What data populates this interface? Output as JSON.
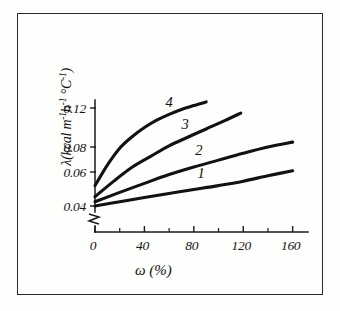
{
  "figure": {
    "has_frame": true,
    "background_color": "#fefefc",
    "ink_color": "#121212"
  },
  "chart_data": {
    "type": "line",
    "title": "",
    "subtitle": "",
    "xlabel": "ω (%)",
    "ylabel": "λ(kcal m⁻¹h⁻¹ °C⁻¹)",
    "ylabel_parts": {
      "symbol": "λ(kcal m",
      "sup1": "-1",
      "mid1": "h",
      "sup2": "-1",
      "mid2": " °C",
      "sup3": "-1",
      "close": ")"
    },
    "xlabel_parts": {
      "symbol": "ω",
      "unit": "(%)"
    },
    "xlim": [
      0,
      170
    ],
    "ylim": [
      0.036,
      0.132
    ],
    "axis_break_y": true,
    "axis_break_note": "zigzag break on y-axis below 0.04",
    "grid": false,
    "legend": "inline curve numbers",
    "xticks": [
      0,
      40,
      80,
      120,
      160
    ],
    "xtick_labels": [
      "0",
      "40",
      "80",
      "120",
      "160"
    ],
    "xticks_minor": [
      20,
      60,
      100,
      140
    ],
    "yticks": [
      0.04,
      0.06,
      0.08,
      0.12
    ],
    "ytick_labels": [
      "0.04",
      "0.06",
      "0.08",
      "0.12"
    ],
    "series": [
      {
        "name": "1",
        "label": "1",
        "label_x": 86,
        "label_y": 0.0565,
        "x": [
          0,
          20,
          40,
          60,
          80,
          100,
          120,
          140,
          160
        ],
        "y": [
          0.04,
          0.0425,
          0.045,
          0.0474,
          0.0497,
          0.052,
          0.0546,
          0.0578,
          0.061
        ]
      },
      {
        "name": "2",
        "label": "2",
        "label_x": 84,
        "label_y": 0.0735,
        "x": [
          0,
          20,
          40,
          60,
          80,
          100,
          120,
          140,
          160
        ],
        "y": [
          0.0425,
          0.048,
          0.0533,
          0.0585,
          0.064,
          0.0695,
          0.075,
          0.08,
          0.085
        ]
      },
      {
        "name": "3",
        "label": "3",
        "label_x": 73,
        "label_y": 0.0985,
        "x": [
          0,
          15,
          30,
          45,
          60,
          75,
          90,
          105,
          118
        ],
        "y": [
          0.0455,
          0.0545,
          0.0638,
          0.0725,
          0.0812,
          0.09,
          0.0985,
          0.107,
          0.1148
        ]
      },
      {
        "name": "4",
        "label": "4",
        "label_x": 60,
        "label_y": 0.1215,
        "x": [
          0,
          10,
          20,
          30,
          40,
          50,
          60,
          70,
          80,
          90
        ],
        "y": [
          0.052,
          0.0655,
          0.079,
          0.0905,
          0.1,
          0.1075,
          0.1135,
          0.1185,
          0.1225,
          0.1262
        ]
      }
    ]
  }
}
